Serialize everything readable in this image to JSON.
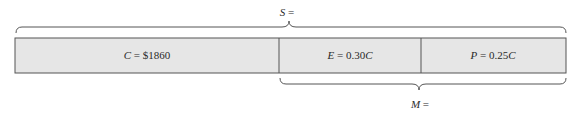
{
  "diagram": {
    "segments": [
      {
        "var": "C",
        "expr": " = $1860"
      },
      {
        "var": "E",
        "expr": " = 0.30",
        "suffix_var": "C"
      },
      {
        "var": "P",
        "expr": " = 0.25",
        "suffix_var": "C"
      }
    ],
    "top_brace": {
      "var": "S",
      "expr": " ="
    },
    "bottom_brace": {
      "var": "M",
      "expr": " ="
    },
    "colors": {
      "fill": "#e6e6e6",
      "stroke": "#555555"
    }
  }
}
